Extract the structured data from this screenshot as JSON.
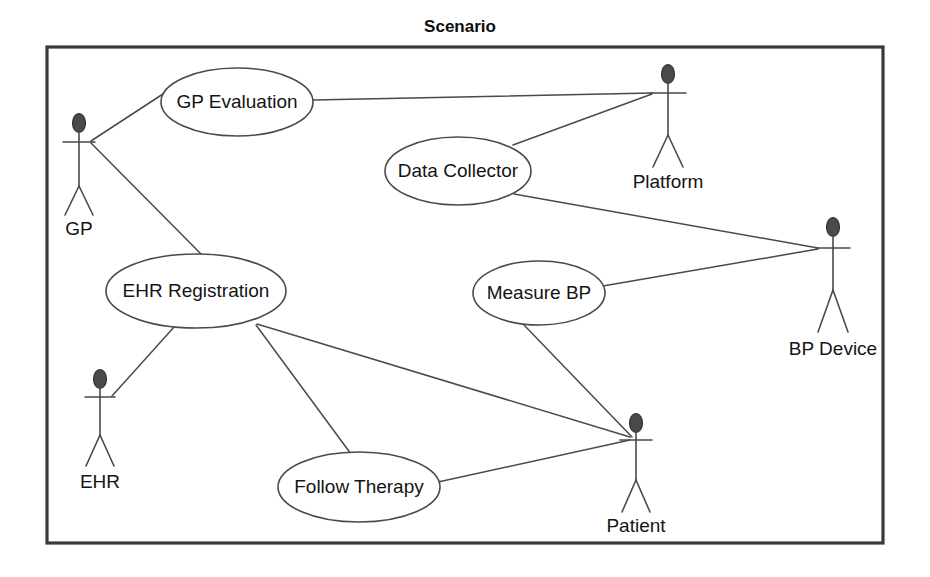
{
  "diagram": {
    "title": "Scenario",
    "type": "uml-use-case-diagram",
    "frame": {
      "x": 47,
      "y": 47,
      "width": 836,
      "height": 496
    },
    "title_position": {
      "x": 460,
      "y": 28
    },
    "colors": {
      "frame_stroke": "#3a3a3a",
      "line_stroke": "#4a4a4a",
      "ellipse_fill": "#ffffff",
      "ellipse_stroke": "#4a4a4a",
      "actor_head_fill": "#4a4a4a",
      "text": "#141414",
      "background": "#ffffff"
    }
  },
  "use_cases": [
    {
      "id": "gp-evaluation",
      "label": "GP Evaluation",
      "cx": 237,
      "cy": 102,
      "rx": 76,
      "ry": 34
    },
    {
      "id": "data-collector",
      "label": "Data Collector",
      "cx": 458,
      "cy": 171,
      "rx": 73,
      "ry": 34
    },
    {
      "id": "ehr-registration",
      "label": "EHR Registration",
      "cx": 196,
      "cy": 291,
      "rx": 90,
      "ry": 37
    },
    {
      "id": "measure-bp",
      "label": "Measure BP",
      "cx": 539,
      "cy": 293,
      "rx": 66,
      "ry": 32
    },
    {
      "id": "follow-therapy",
      "label": "Follow Therapy",
      "cx": 359,
      "cy": 487,
      "rx": 81,
      "ry": 35
    }
  ],
  "actors": [
    {
      "id": "gp",
      "label": "GP",
      "x": 79,
      "head_cy": 123,
      "arms_y": 142,
      "arm_half": 16,
      "body_bottom": 186,
      "leg_spread": 14,
      "leg_bottom": 215,
      "label_y": 230
    },
    {
      "id": "platform",
      "label": "Platform",
      "x": 668,
      "head_cy": 74,
      "arms_y": 93,
      "arm_half": 18,
      "body_bottom": 135,
      "leg_spread": 15,
      "leg_bottom": 167,
      "label_y": 183
    },
    {
      "id": "bp-device",
      "label": "BP Device",
      "x": 833,
      "head_cy": 227,
      "arms_y": 248,
      "arm_half": 17,
      "body_bottom": 290,
      "leg_spread": 15,
      "leg_bottom": 332,
      "label_y": 350
    },
    {
      "id": "ehr",
      "label": "EHR",
      "x": 100,
      "head_cy": 379,
      "arms_y": 397,
      "arm_half": 15,
      "body_bottom": 435,
      "leg_spread": 14,
      "leg_bottom": 466,
      "label_y": 483
    },
    {
      "id": "patient",
      "label": "Patient",
      "x": 636,
      "head_cy": 423,
      "arms_y": 440,
      "arm_half": 16,
      "body_bottom": 480,
      "leg_spread": 14,
      "leg_bottom": 512,
      "label_y": 527
    }
  ],
  "associations": [
    {
      "id": "gp--gp-evaluation",
      "from": "gp",
      "to": "gp-evaluation",
      "x1": 91,
      "y1": 141,
      "x2": 166,
      "y2": 92
    },
    {
      "id": "gp--ehr-registration",
      "from": "gp",
      "to": "ehr-registration",
      "x1": 91,
      "y1": 143,
      "x2": 203,
      "y2": 256
    },
    {
      "id": "gp-evaluation--platform",
      "from": "gp-evaluation",
      "to": "platform",
      "x1": 313,
      "y1": 100,
      "x2": 652,
      "y2": 93
    },
    {
      "id": "data-collector--platform",
      "from": "data-collector",
      "to": "platform",
      "x1": 513,
      "y1": 145,
      "x2": 652,
      "y2": 94
    },
    {
      "id": "data-collector--bp-device",
      "from": "data-collector",
      "to": "bp-device",
      "x1": 514,
      "y1": 194,
      "x2": 818,
      "y2": 248
    },
    {
      "id": "measure-bp--bp-device",
      "from": "measure-bp",
      "to": "bp-device",
      "x1": 603,
      "y1": 286,
      "x2": 818,
      "y2": 249
    },
    {
      "id": "measure-bp--patient",
      "from": "measure-bp",
      "to": "patient",
      "x1": 524,
      "y1": 325,
      "x2": 632,
      "y2": 437
    },
    {
      "id": "ehr-registration--ehr",
      "from": "ehr-registration",
      "to": "ehr",
      "x1": 175,
      "y1": 326,
      "x2": 112,
      "y2": 396
    },
    {
      "id": "ehr-registration--follow-therapy",
      "from": "ehr-registration",
      "to": "follow-therapy",
      "x1": 256,
      "y1": 325,
      "x2": 351,
      "y2": 454
    },
    {
      "id": "ehr-registration--patient",
      "from": "ehr-registration",
      "to": "patient",
      "x1": 257,
      "y1": 324,
      "x2": 630,
      "y2": 437
    },
    {
      "id": "follow-therapy--patient",
      "from": "follow-therapy",
      "to": "patient",
      "x1": 438,
      "y1": 482,
      "x2": 630,
      "y2": 440
    }
  ]
}
